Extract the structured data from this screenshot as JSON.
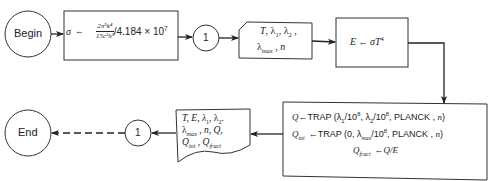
{
  "diagram": {
    "type": "flowchart",
    "nodes": {
      "begin": {
        "shape": "terminal-circle",
        "label": "Begin"
      },
      "sigma_calc": {
        "shape": "process",
        "target": "σ",
        "arrow": "←",
        "fraction_numerator": "2π⁵k⁴",
        "fraction_denominator": "15c²h³",
        "divisor": "/4.184 × 10⁷"
      },
      "connector_top": {
        "shape": "connector",
        "label": "1"
      },
      "input_card": {
        "shape": "card",
        "line1": "T, λ₁, λ₂ ,",
        "line2": "λmax , n"
      },
      "e_calc": {
        "shape": "process",
        "text": "E ← σT⁴"
      },
      "trap_calc": {
        "shape": "process",
        "line1": "Q ← TRAP (λ₁/10⁸,  λ₂/10⁸, PLANCK , n)",
        "line2": "Qtot ← TRAP (0, λmax/10⁸, PLANCK , n)",
        "line3": "Qfract ← Q/E"
      },
      "output_doc": {
        "shape": "document",
        "line1": "T, E,  λ₁,  λ₂,",
        "line2": "λmax , n, Q,",
        "line3": "Qtot , Qfract"
      },
      "connector_bottom": {
        "shape": "connector",
        "label": "1"
      },
      "end": {
        "shape": "terminal-circle",
        "label": "End"
      }
    },
    "edges": [
      {
        "from": "begin",
        "to": "sigma_calc",
        "style": "solid"
      },
      {
        "from": "sigma_calc",
        "to": "connector_top",
        "style": "solid"
      },
      {
        "from": "connector_top",
        "to": "input_card",
        "style": "solid"
      },
      {
        "from": "input_card",
        "to": "e_calc",
        "style": "solid"
      },
      {
        "from": "e_calc",
        "to": "trap_calc",
        "style": "solid"
      },
      {
        "from": "trap_calc",
        "to": "output_doc",
        "style": "solid"
      },
      {
        "from": "output_doc",
        "to": "connector_bottom",
        "style": "solid"
      },
      {
        "from": "connector_bottom",
        "to": "end",
        "style": "dashed"
      }
    ]
  },
  "text": {
    "begin": "Begin",
    "end": "End",
    "conn": "1",
    "sigma": "σ",
    "arrow": "←",
    "num": "2π⁵k⁴",
    "den": "15c²h³",
    "divisor": "/4.184 × 10",
    "divisor_exp": "7",
    "card_T": "T, λ",
    "card_sub1": "1",
    "card_mid": ", λ",
    "card_sub2": "2",
    "card_end": " ,",
    "lambda": "λ",
    "max": "max",
    "card_n": " , n",
    "E": "E",
    "sigmaT": "σT",
    "four": "4",
    "Q": "Q",
    "trap": "TRAP (λ",
    "one": "1",
    "two": "2",
    "over108a": "/10",
    "eight": "8",
    "comma_l": ",  λ",
    "planck_n": ", PLANCK , ",
    "n": "n",
    "close": ")",
    "Qtot_Q": "Q",
    "tot": "tot",
    "trap0": "TRAP (0, λ",
    "fract": "fract",
    "QE": "Q/E",
    "out1": "T, E,  λ",
    "out1b": ",  λ",
    "out1c": ".",
    "out2b": " , n, Q,",
    "out3a": "Q",
    "out3b": " , Q"
  }
}
